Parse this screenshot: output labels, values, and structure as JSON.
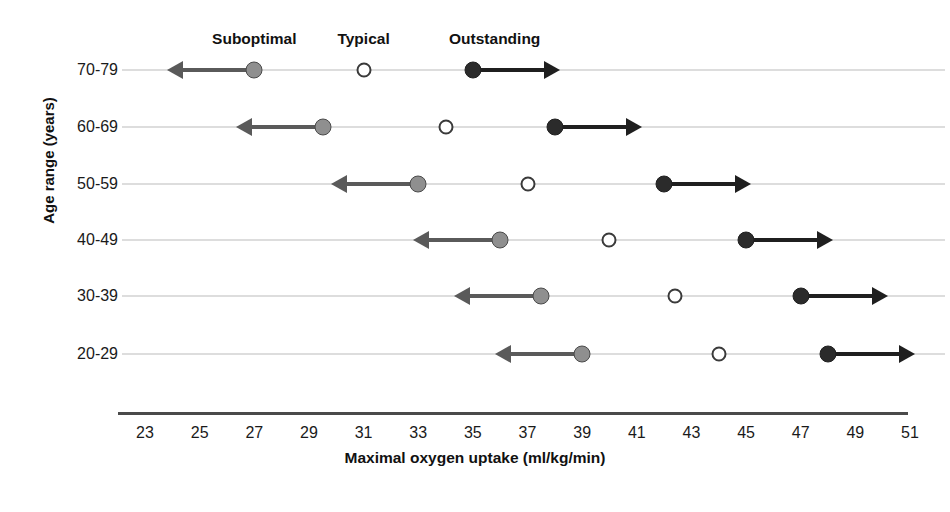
{
  "chart_data": {
    "type": "scatter",
    "title": "",
    "xlabel": "Maximal oxygen uptake (ml/kg/min)",
    "ylabel": "Age range (years)",
    "xlim": [
      23,
      51
    ],
    "xticks": [
      23,
      25,
      27,
      29,
      31,
      33,
      35,
      37,
      39,
      41,
      43,
      45,
      47,
      49,
      51
    ],
    "xtick_labels": [
      "23",
      "25",
      "27",
      "29",
      "31",
      "33",
      "35",
      "37",
      "39",
      "41",
      "43",
      "45",
      "47",
      "49",
      "51"
    ],
    "grid": false,
    "legend_position": "top",
    "categories": [
      "70-79",
      "60-69",
      "50-59",
      "40-49",
      "30-39",
      "20-29"
    ],
    "series": [
      {
        "name": "Suboptimal",
        "marker": "filled-gray-circle",
        "color": "#8f8f8f",
        "arrow": "left",
        "values": [
          27,
          29.5,
          33,
          36,
          37.5,
          39
        ]
      },
      {
        "name": "Typical",
        "marker": "open-circle",
        "color": "#ffffff",
        "arrow": "none",
        "values": [
          31,
          34,
          37,
          40,
          42.4,
          44
        ]
      },
      {
        "name": "Outstanding",
        "marker": "filled-black-circle",
        "color": "#2b2b2b",
        "arrow": "right",
        "values": [
          35,
          38,
          42,
          45,
          47,
          48
        ]
      }
    ],
    "annotations": [
      {
        "text": "Suboptimal",
        "x": 27
      },
      {
        "text": "Typical",
        "x": 31
      },
      {
        "text": "Outstanding",
        "x": 35.8
      }
    ],
    "colors": {
      "suboptimal": "#8f8f8f",
      "typical": "#ffffff",
      "outstanding": "#2b2b2b",
      "row_line": "#bcbcbc",
      "axis": "#4a4a4a",
      "text": "#1a1a1a"
    }
  }
}
